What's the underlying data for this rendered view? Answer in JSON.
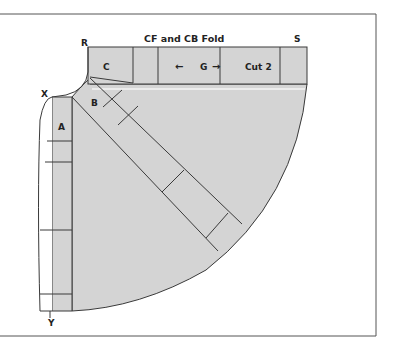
{
  "diagram": {
    "type": "sewing-pattern-layout",
    "title": "CF and CB Fold",
    "point_labels": {
      "r": "R",
      "s": "S",
      "x": "X",
      "y": "Y"
    },
    "piece_labels": {
      "a": "A",
      "b": "B",
      "c": "C"
    },
    "grain": {
      "label": "G",
      "arrow_left": "←",
      "arrow_right": "→"
    },
    "cut_instruction": "Cut 2",
    "colors": {
      "fabric_fill": "#d4d4d4",
      "line": "#3a3a3a",
      "frame": "#555555",
      "background": "#ffffff"
    }
  }
}
